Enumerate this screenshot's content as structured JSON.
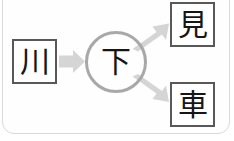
{
  "diagram": {
    "panel": {
      "background_color": "#fefefe",
      "border_color": "#d9d9d9",
      "corner_radius": "12px"
    },
    "nodes": [
      {
        "id": "source",
        "shape": "square",
        "character": "川",
        "meaning": "river",
        "border_color": "#585858",
        "text_color": "#161616"
      },
      {
        "id": "center",
        "shape": "circle",
        "character": "下",
        "meaning": "below",
        "border_color": "#a8a8a8",
        "text_color": "#161616"
      },
      {
        "id": "target-1",
        "shape": "square",
        "character": "見",
        "meaning": "see",
        "border_color": "#585858",
        "text_color": "#161616"
      },
      {
        "id": "target-2",
        "shape": "square",
        "character": "車",
        "meaning": "vehicle",
        "border_color": "#585858",
        "text_color": "#161616"
      }
    ],
    "arrows": [
      {
        "id": "source-to-center",
        "from": "source",
        "to": "center",
        "direction": "right",
        "color": "#d5d5d5"
      },
      {
        "id": "center-to-target-1",
        "from": "center",
        "to": "target-1",
        "direction": "up-right",
        "color": "#d5d5d5"
      },
      {
        "id": "center-to-target-2",
        "from": "center",
        "to": "target-2",
        "direction": "down-right",
        "color": "#d5d5d5"
      }
    ]
  }
}
